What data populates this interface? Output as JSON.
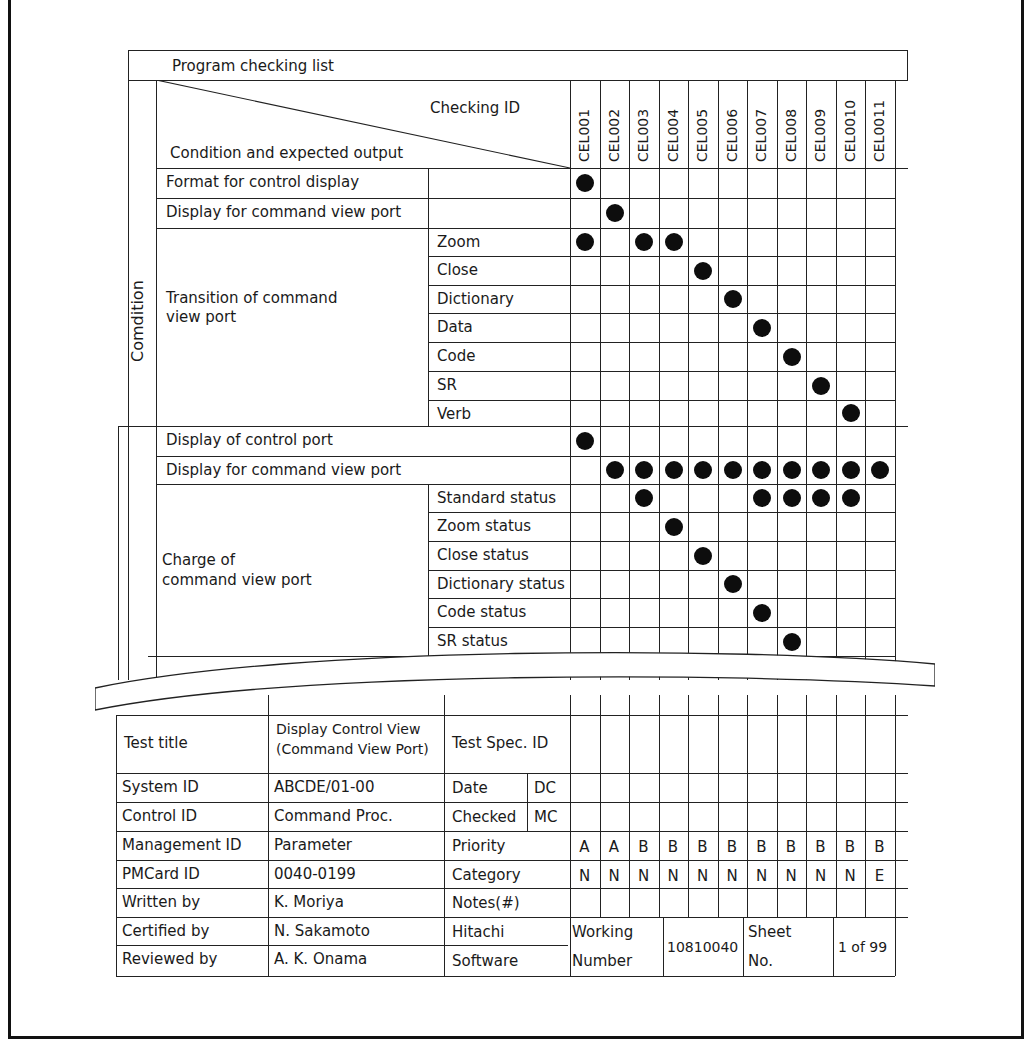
{
  "title": "Program checking list",
  "header": {
    "checking_id_label": "Checking ID",
    "condition_output_label": "Condition and expected output"
  },
  "checking_ids": [
    "CEL001",
    "CEL002",
    "CEL003",
    "CEL004",
    "CEL005",
    "CEL006",
    "CEL007",
    "CEL008",
    "CEL009",
    "CEL0010",
    "CEL0011"
  ],
  "condition_section": {
    "label": "Comdition",
    "rows": [
      {
        "group": "Format for control display",
        "item": "",
        "marks": [
          1,
          0,
          0,
          0,
          0,
          0,
          0,
          0,
          0,
          0,
          0
        ]
      },
      {
        "group": "Display for command view port",
        "item": "",
        "marks": [
          0,
          1,
          0,
          0,
          0,
          0,
          0,
          0,
          0,
          0,
          0
        ]
      },
      {
        "group": "Transition of command view port",
        "item": "Zoom",
        "marks": [
          1,
          0,
          1,
          1,
          0,
          0,
          0,
          0,
          0,
          0,
          0
        ]
      },
      {
        "group": "",
        "item": "Close",
        "marks": [
          0,
          0,
          0,
          0,
          1,
          0,
          0,
          0,
          0,
          0,
          0
        ]
      },
      {
        "group": "",
        "item": "Dictionary",
        "marks": [
          0,
          0,
          0,
          0,
          0,
          1,
          0,
          0,
          0,
          0,
          0
        ]
      },
      {
        "group": "",
        "item": "Data",
        "marks": [
          0,
          0,
          0,
          0,
          0,
          0,
          1,
          0,
          0,
          0,
          0
        ]
      },
      {
        "group": "",
        "item": "Code",
        "marks": [
          0,
          0,
          0,
          0,
          0,
          0,
          0,
          1,
          0,
          0,
          0
        ]
      },
      {
        "group": "",
        "item": "SR",
        "marks": [
          0,
          0,
          0,
          0,
          0,
          0,
          0,
          0,
          1,
          0,
          0
        ]
      },
      {
        "group": "",
        "item": "Verb",
        "marks": [
          0,
          0,
          0,
          0,
          0,
          0,
          0,
          0,
          0,
          1,
          0
        ]
      }
    ],
    "transition_group_line1": "Transition of command",
    "transition_group_line2": "view port"
  },
  "output_section": {
    "rows": [
      {
        "group": "Display of control port",
        "item": "",
        "marks": [
          1,
          0,
          0,
          0,
          0,
          0,
          0,
          0,
          0,
          0,
          0
        ]
      },
      {
        "group": "Display for command view port",
        "item": "",
        "marks": [
          0,
          1,
          1,
          1,
          1,
          1,
          1,
          1,
          1,
          1,
          1
        ]
      },
      {
        "group": "Charge of command view port",
        "item": "Standard status",
        "marks": [
          0,
          0,
          1,
          0,
          0,
          0,
          1,
          1,
          1,
          1,
          0
        ]
      },
      {
        "group": "",
        "item": "Zoom status",
        "marks": [
          0,
          0,
          0,
          1,
          0,
          0,
          0,
          0,
          0,
          0,
          0
        ]
      },
      {
        "group": "",
        "item": "Close status",
        "marks": [
          0,
          0,
          0,
          0,
          1,
          0,
          0,
          0,
          0,
          0,
          0
        ]
      },
      {
        "group": "",
        "item": "Dictionary status",
        "marks": [
          0,
          0,
          0,
          0,
          0,
          1,
          0,
          0,
          0,
          0,
          0
        ]
      },
      {
        "group": "",
        "item": "Code status",
        "marks": [
          0,
          0,
          0,
          0,
          0,
          0,
          1,
          0,
          0,
          0,
          0
        ]
      },
      {
        "group": "",
        "item": "SR status",
        "marks": [
          0,
          0,
          0,
          0,
          0,
          0,
          0,
          1,
          0,
          0,
          0
        ]
      }
    ],
    "charge_group_line1": "Charge of",
    "charge_group_line2": "command view port"
  },
  "footer": {
    "test_title_label": "Test title",
    "test_title_value_line1": "Display Control View",
    "test_title_value_line2": "(Command View Port)",
    "test_spec_id_label": "Test Spec. ID",
    "system_id_label": "System ID",
    "system_id_value": "ABCDE/01-00",
    "control_id_label": "Control ID",
    "control_id_value": "Command Proc.",
    "management_id_label": "Management ID",
    "management_id_value": "Parameter",
    "pmcard_id_label": "PMCard ID",
    "pmcard_id_value": "0040-0199",
    "written_by_label": "Written by",
    "written_by_value": "K. Moriya",
    "certified_by_label": "Certified by",
    "certified_by_value": "N. Sakamoto",
    "reviewed_by_label": "Reviewed by",
    "reviewed_by_value": "A. K. Onama",
    "date_label": "Date",
    "checked_label": "Checked",
    "dc_label": "DC",
    "mc_label": "MC",
    "priority_label": "Priority",
    "priority_values": [
      "A",
      "A",
      "B",
      "B",
      "B",
      "B",
      "B",
      "B",
      "B",
      "B",
      "B"
    ],
    "category_label": "Category",
    "category_values": [
      "N",
      "N",
      "N",
      "N",
      "N",
      "N",
      "N",
      "N",
      "N",
      "N",
      "E"
    ],
    "notes_label": "Notes(#)",
    "company_line1": "Hitachi",
    "company_line2": "Software",
    "working_number_line1": "Working",
    "working_number_line2": "Number",
    "working_number_value": "10810040",
    "sheet_no_line1": "Sheet",
    "sheet_no_line2": "No.",
    "sheet_no_value": "1 of 99"
  }
}
